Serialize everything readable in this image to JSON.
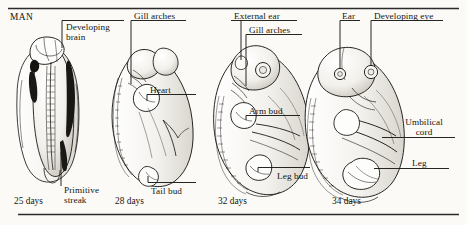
{
  "figure": {
    "heading": "MAN",
    "background_color": "#fbfaf7",
    "ink_color": "#16140f",
    "rule_color": "#2b2b2b"
  },
  "stages": [
    {
      "id": "stage-25-days",
      "day_label": "25 days",
      "labels": [
        {
          "name": "developing-brain",
          "text": "Developing brain",
          "lines": [
            "Developing",
            "brain"
          ]
        },
        {
          "name": "primitive-streak",
          "text": "Primitive streak",
          "lines": [
            "Primitive",
            "streak"
          ]
        }
      ]
    },
    {
      "id": "stage-28-days",
      "day_label": "28 days",
      "labels": [
        {
          "name": "gill-arches",
          "text": "Gill arches",
          "lines": [
            "Gill arches"
          ]
        },
        {
          "name": "heart",
          "text": "Heart",
          "lines": [
            "Heart"
          ]
        },
        {
          "name": "tail-bud",
          "text": "Tail bud",
          "lines": [
            "Tail bud"
          ]
        }
      ]
    },
    {
      "id": "stage-32-days",
      "day_label": "32 days",
      "labels": [
        {
          "name": "external-ear",
          "text": "External ear",
          "lines": [
            "External ear"
          ]
        },
        {
          "name": "gill-arches",
          "text": "Gill arches",
          "lines": [
            "Gill arches"
          ]
        },
        {
          "name": "arm-bud",
          "text": "Arm bud",
          "lines": [
            "Arm bud"
          ]
        },
        {
          "name": "leg-bud",
          "text": "Leg bud",
          "lines": [
            "Leg bud"
          ]
        }
      ]
    },
    {
      "id": "stage-34-days",
      "day_label": "34 days",
      "labels": [
        {
          "name": "ear",
          "text": "Ear",
          "lines": [
            "Ear"
          ]
        },
        {
          "name": "developing-eye",
          "text": "Developing eye",
          "lines": [
            "Developing eye"
          ]
        },
        {
          "name": "umbilical-cord",
          "text": "Umbilical cord",
          "lines": [
            "Umbilical",
            "cord"
          ]
        },
        {
          "name": "leg",
          "text": "Leg",
          "lines": [
            "Leg"
          ]
        }
      ]
    }
  ],
  "text": {
    "man": "MAN",
    "developing_brain_l1": "Developing",
    "developing_brain_l2": "brain",
    "primitive_streak_l1": "Primitive",
    "primitive_streak_l2": "streak",
    "gill_arches_28": "Gill arches",
    "heart": "Heart",
    "tail_bud": "Tail bud",
    "external_ear": "External ear",
    "gill_arches_32": "Gill arches",
    "arm_bud": "Arm bud",
    "leg_bud": "Leg bud",
    "ear": "Ear",
    "developing_eye": "Developing eye",
    "umbilical_cord_l1": "Umbilical",
    "umbilical_cord_l2": "cord",
    "leg": "Leg",
    "day_25": "25 days",
    "day_28": "28 days",
    "day_32": "32 days",
    "day_34": "34 days"
  }
}
